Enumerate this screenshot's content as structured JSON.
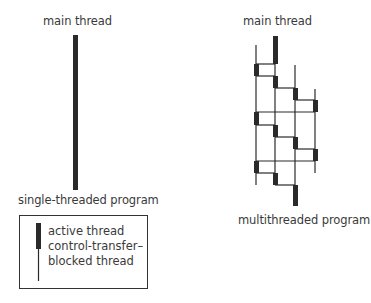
{
  "single": {
    "top_label": "main thread",
    "bottom_label": "single-threaded program"
  },
  "multi": {
    "top_label": "main thread",
    "bottom_label": "multithreaded program",
    "threads": 4,
    "thread_x": [
      256,
      275,
      295,
      315
    ],
    "active_segments": [
      {
        "thread": 2,
        "y1": 36,
        "y2": 64
      },
      {
        "thread": 1,
        "y1": 64,
        "y2": 76
      },
      {
        "thread": 2,
        "y1": 76,
        "y2": 88
      },
      {
        "thread": 3,
        "y1": 88,
        "y2": 100
      },
      {
        "thread": 4,
        "y1": 100,
        "y2": 112
      },
      {
        "thread": 1,
        "y1": 112,
        "y2": 125
      },
      {
        "thread": 2,
        "y1": 125,
        "y2": 137
      },
      {
        "thread": 3,
        "y1": 137,
        "y2": 149
      },
      {
        "thread": 4,
        "y1": 149,
        "y2": 161
      },
      {
        "thread": 1,
        "y1": 161,
        "y2": 173
      },
      {
        "thread": 2,
        "y1": 173,
        "y2": 185
      },
      {
        "thread": 3,
        "y1": 185,
        "y2": 206
      }
    ]
  },
  "legend": {
    "active_label": "active thread",
    "blocked_label_line1": "control-transfer–",
    "blocked_label_line2": "blocked thread"
  },
  "colors": {
    "line": "#2a2a2a",
    "text": "#3a3a3a",
    "background": "#ffffff"
  }
}
